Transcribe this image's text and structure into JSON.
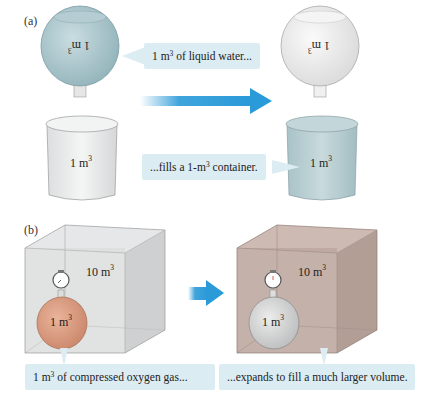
{
  "panel_a": {
    "label": "(a)",
    "flask_left": {
      "volume": "1",
      "unit": "m",
      "exp": "3",
      "fill": "#9fbfc6"
    },
    "flask_right": {
      "volume": "1",
      "unit": "m",
      "exp": "3",
      "fill": "#ececec"
    },
    "callout_top": {
      "pre": "1 m",
      "exp": "3",
      "post": " of liquid water..."
    },
    "callout_bottom": {
      "pre": "...fills a 1-m",
      "exp": "3",
      "post": " container."
    },
    "beaker_left": {
      "volume": "1 m",
      "exp": "3",
      "fill": "#e8eaeb"
    },
    "beaker_right": {
      "volume": "1 m",
      "exp": "3",
      "fill": "#b8cfd3"
    },
    "arrow_color": "#2a9ad8"
  },
  "panel_b": {
    "label": "(b)",
    "box_left": {
      "volume": "10 m",
      "exp": "3",
      "fill": "#d9dadb"
    },
    "box_right": {
      "volume": "10 m",
      "exp": "3",
      "fill": "#bfaaa2"
    },
    "flask_left": {
      "volume": "1 m",
      "exp": "3",
      "fill": "#d99c82"
    },
    "flask_right": {
      "volume": "1 m",
      "exp": "3",
      "fill": "#d2d3d4"
    },
    "callout_left": {
      "pre": "1 m",
      "exp": "3",
      "post": " of compressed oxygen gas..."
    },
    "callout_right": {
      "text": "...expands to fill a much larger volume."
    },
    "arrow_color": "#2a9ad8"
  }
}
